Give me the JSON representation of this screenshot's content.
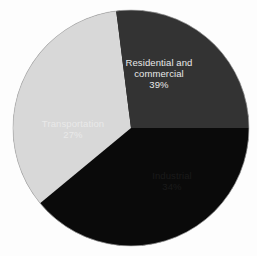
{
  "chart_data": {
    "type": "pie",
    "title": "",
    "subtitle": "",
    "xlabel": "",
    "ylabel": "",
    "legend_position": "none",
    "labels_inside_slices": true,
    "units": "percent",
    "total": 100,
    "categories": [
      "Residential and commercial",
      "Industrial",
      "Transportation"
    ],
    "values": [
      39,
      34,
      27
    ],
    "slices": [
      {
        "name": "Residential and commercial",
        "name_line_1": "Residential and",
        "name_line_2": "commercial",
        "value": 39,
        "value_label": "39%",
        "color": "#0a0a0a",
        "text_color": "#e9e9e9",
        "start_angle_deg": 309,
        "end_angle_deg": 90
      },
      {
        "name": "Industrial",
        "name_line_1": "Industrial",
        "name_line_2": "",
        "value": 34,
        "value_label": "34%",
        "color": "#d8d8d8",
        "text_color": "#1a1a1a",
        "start_angle_deg": 90,
        "end_angle_deg": 212.4
      },
      {
        "name": "Transportation",
        "name_line_1": "Transportation",
        "name_line_2": "",
        "value": 27,
        "value_label": "27%",
        "color": "#333333",
        "text_color": "#e9e9e9",
        "start_angle_deg": 212.4,
        "end_angle_deg": 309
      }
    ],
    "geometry": {
      "center_x": 131,
      "center_y": 128,
      "radius": 118,
      "start_angle_deg": 90,
      "direction": "clockwise"
    },
    "background_color": "#fdfdfd"
  }
}
